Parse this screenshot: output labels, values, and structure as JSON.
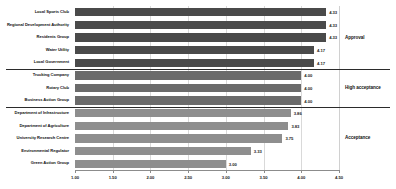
{
  "chart_data": {
    "type": "bar",
    "orientation": "horizontal",
    "title": "",
    "xlabel": "",
    "ylabel": "",
    "xlim": [
      1.0,
      4.5
    ],
    "grid": true,
    "legend": "none",
    "categories": [
      "Local Sports Club",
      "Regional Development Authority",
      "Residents Group",
      "Water Utility",
      "Local Government",
      "Trucking Company",
      "Rotary Club",
      "Business Action Group",
      "Department of Infrastructure",
      "Department of Agriculture",
      "University Research Centre",
      "Environmental Regulator",
      "Green Action Group"
    ],
    "values": [
      4.33,
      4.33,
      4.33,
      4.17,
      4.17,
      4.0,
      4.0,
      4.0,
      3.86,
      3.83,
      3.75,
      3.33,
      3.0
    ],
    "value_labels": [
      "4.33",
      "4.33",
      "4.33",
      "4.17",
      "4.17",
      "4.00",
      "4.00",
      "4.00",
      "3.86",
      "3.83",
      "3.75",
      "3.33",
      "3.00"
    ],
    "ticks": [
      1.0,
      1.5,
      2.0,
      2.5,
      3.0,
      3.5,
      4.0,
      4.5
    ],
    "tick_labels": [
      "1.00",
      "1.50",
      "2.00",
      "2.50",
      "3.00",
      "3.50",
      "4.00",
      "4.50"
    ],
    "groups": [
      {
        "label": "Approval",
        "start_index": 0,
        "end_index": 4,
        "color": "#4a4a4a"
      },
      {
        "label": "High acceptance",
        "start_index": 5,
        "end_index": 7,
        "color": "#6b6b6b"
      },
      {
        "label": "Acceptance",
        "start_index": 8,
        "end_index": 12,
        "color": "#8e8e8e"
      }
    ]
  }
}
